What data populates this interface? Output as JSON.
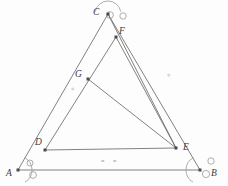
{
  "figure": {
    "background": "#fdfdfd",
    "stroke_color": "#6b6b6b",
    "vertex_color": "#4a4a4a",
    "marker_color": "#9a9a9a",
    "label_color": "#3a3a3a"
  },
  "points": [
    {
      "id": "A",
      "label": "A",
      "x": 18,
      "y": 170,
      "label_x": 6,
      "label_y": 169,
      "dot": true
    },
    {
      "id": "B",
      "label": "B",
      "x": 200,
      "y": 170,
      "label_x": 211,
      "label_y": 169,
      "dot": true
    },
    {
      "id": "C",
      "label": "C",
      "x": 108,
      "y": 14,
      "label_x": 93,
      "label_y": 8,
      "dot": true
    },
    {
      "id": "D",
      "label": "D",
      "x": 45,
      "y": 150,
      "label_x": 35,
      "label_y": 138,
      "dot": true
    },
    {
      "id": "E",
      "label": "E",
      "x": 176,
      "y": 148,
      "label_x": 183,
      "label_y": 143,
      "dot": true
    },
    {
      "id": "F",
      "label": "F",
      "x": 116,
      "y": 37,
      "label_x": 119,
      "label_y": 27,
      "dot": true
    },
    {
      "id": "G",
      "label": "G",
      "x": 88,
      "y": 79,
      "label_x": 75,
      "label_y": 70,
      "dot": true
    }
  ],
  "segments": [
    {
      "id": "AC",
      "from": "A",
      "to": "C"
    },
    {
      "id": "AB",
      "from": "A",
      "to": "B"
    },
    {
      "id": "CB",
      "from": "C",
      "to": "B"
    },
    {
      "id": "DF",
      "from": "D",
      "to": "F"
    },
    {
      "id": "FE",
      "from": "F",
      "to": "E"
    },
    {
      "id": "DE",
      "from": "D",
      "to": "E"
    },
    {
      "id": "GE",
      "from": "G",
      "to": "E"
    },
    {
      "id": "CE",
      "from": "C",
      "to": "E"
    }
  ],
  "tick_marks": [
    {
      "id": "tick-ac",
      "glyph": "≡",
      "x": 71,
      "y": 86,
      "rotate": -28
    },
    {
      "id": "tick-cb",
      "glyph": "≡",
      "x": 167,
      "y": 72,
      "rotate": 30
    },
    {
      "id": "tick-de-left",
      "glyph": "≡",
      "x": 101,
      "y": 158,
      "rotate": 0
    },
    {
      "id": "tick-de-right",
      "glyph": "≡",
      "x": 113,
      "y": 158,
      "rotate": 0
    }
  ],
  "angle_arcs": [
    {
      "id": "arc-a",
      "cx": 18,
      "cy": 170,
      "r": 14,
      "start": 300,
      "end": 62
    },
    {
      "id": "arc-b",
      "cx": 200,
      "cy": 170,
      "r": 14,
      "start": 118,
      "end": 240
    },
    {
      "id": "arc-c",
      "cx": 108,
      "cy": 14,
      "r": 13,
      "start": 10,
      "end": 170
    }
  ],
  "open_circles": [
    {
      "id": "circle-a-1",
      "cx": 30,
      "cy": 163,
      "r": 3.0
    },
    {
      "id": "circle-a-2",
      "cx": 33,
      "cy": 175,
      "r": 3.4
    },
    {
      "id": "circle-b-1",
      "cx": 211,
      "cy": 161,
      "r": 3.2
    },
    {
      "id": "circle-b-2",
      "cx": 206,
      "cy": 174,
      "r": 3.6
    },
    {
      "id": "circle-c-1",
      "cx": 110,
      "cy": 15,
      "r": 3.4
    },
    {
      "id": "circle-c-2",
      "cx": 123,
      "cy": 16,
      "r": 3.2
    }
  ]
}
